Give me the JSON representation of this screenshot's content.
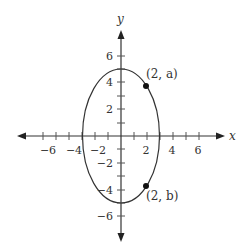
{
  "diagram": {
    "type": "coordinate-plane-ellipse",
    "axes": {
      "x_label": "x",
      "y_label": "y",
      "x_ticks": [
        {
          "value": -6,
          "label": "−6"
        },
        {
          "value": -4,
          "label": "−4"
        },
        {
          "value": -2,
          "label": "−2"
        },
        {
          "value": 2,
          "label": "2"
        },
        {
          "value": 4,
          "label": "4"
        },
        {
          "value": 6,
          "label": "6"
        }
      ],
      "y_ticks": [
        {
          "value": 6,
          "label": "6"
        },
        {
          "value": 4,
          "label": "4"
        },
        {
          "value": 2,
          "label": "2"
        },
        {
          "value": -2,
          "label": "−2"
        },
        {
          "value": -4,
          "label": "−4"
        },
        {
          "value": -6,
          "label": "−6"
        }
      ]
    },
    "ellipse": {
      "center": [
        0,
        0
      ],
      "semi_axis_x": 3,
      "semi_axis_y": 5
    },
    "points": [
      {
        "x": 2,
        "y_approx": 3.73,
        "label": "(2, a)"
      },
      {
        "x": 2,
        "y_approx": -3.73,
        "label": "(2, b)"
      }
    ],
    "colors": {
      "stroke": "#333333",
      "point": "#111111"
    }
  }
}
